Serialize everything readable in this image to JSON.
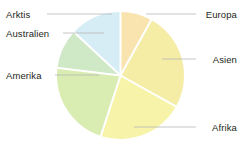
{
  "chart_data": {
    "type": "pie",
    "title": "",
    "xlabel": "",
    "ylabel": "",
    "legend_position": "callout-labels",
    "grid": false,
    "categories": [
      "Europa",
      "Asien",
      "Afrika",
      "Amerika",
      "Australien",
      "Arktis"
    ],
    "values": [
      8,
      25,
      22,
      22,
      10,
      13
    ],
    "units": "percent",
    "slices": [
      {
        "label": "Europa",
        "value": 8,
        "color": "#f9e4b0",
        "start_angle": 0,
        "end_angle": 29
      },
      {
        "label": "Asien",
        "value": 25,
        "color": "#f5eca6",
        "start_angle": 29,
        "end_angle": 119
      },
      {
        "label": "Afrika",
        "value": 22,
        "color": "#f7f4a9",
        "start_angle": 119,
        "end_angle": 198
      },
      {
        "label": "Amerika",
        "value": 22,
        "color": "#d9edb2",
        "start_angle": 198,
        "end_angle": 277
      },
      {
        "label": "Australien",
        "value": 10,
        "color": "#cfe8c6",
        "start_angle": 277,
        "end_angle": 313
      },
      {
        "label": "Arktis",
        "value": 13,
        "color": "#d6edf6",
        "start_angle": 313,
        "end_angle": 360
      }
    ]
  },
  "labels": {
    "europa": "Europa",
    "asien": "Asien",
    "afrika": "Afrika",
    "amerika": "Amerika",
    "australien": "Australien",
    "arktis": "Arktis"
  },
  "colors": {
    "europa": "#f9e4b0",
    "asien": "#f5eca6",
    "afrika": "#f7f4a9",
    "amerika": "#d9edb2",
    "australien": "#cfe8c6",
    "arktis": "#d6edf6",
    "leader_line": "#b7b7b7",
    "slice_divider": "#ffffff",
    "text": "#231f20",
    "background": "#ffffff"
  }
}
